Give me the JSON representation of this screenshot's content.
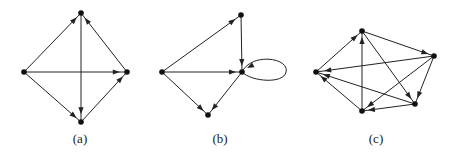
{
  "figure": {
    "edge_color": "#222222",
    "node_color": "#111111",
    "graphs": [
      {
        "label": "(a)",
        "label_x": 80,
        "nodes": {
          "top": [
            81,
            13
          ],
          "left": [
            24,
            72
          ],
          "right": [
            127,
            72
          ],
          "bottom": [
            81,
            122
          ]
        },
        "edges": [
          [
            "left",
            "top"
          ],
          [
            "right",
            "top"
          ],
          [
            "left",
            "right"
          ],
          [
            "top",
            "bottom"
          ],
          [
            "left",
            "bottom"
          ],
          [
            "bottom",
            "right"
          ]
        ],
        "loops": []
      },
      {
        "label": "(b)",
        "label_x": 220,
        "nodes": {
          "top": [
            241,
            15
          ],
          "left": [
            162,
            72
          ],
          "right": [
            242,
            72
          ],
          "bottom": [
            208,
            115
          ]
        },
        "edges": [
          [
            "left",
            "top"
          ],
          [
            "top",
            "right"
          ],
          [
            "left",
            "right"
          ],
          [
            "left",
            "bottom"
          ],
          [
            "right",
            "bottom"
          ]
        ],
        "loops": [
          "right"
        ]
      },
      {
        "label": "(c)",
        "label_x": 376,
        "nodes": {
          "top": [
            362,
            31
          ],
          "left": [
            316,
            72
          ],
          "right": [
            434,
            56
          ],
          "bottomright": [
            415,
            104
          ],
          "bottom": [
            362,
            111
          ]
        },
        "edges": [
          [
            "left",
            "top"
          ],
          [
            "bottom",
            "top"
          ],
          [
            "top",
            "right"
          ],
          [
            "top",
            "bottomright"
          ],
          [
            "right",
            "left"
          ],
          [
            "bottomright",
            "left"
          ],
          [
            "bottom",
            "left"
          ],
          [
            "right",
            "bottomright"
          ],
          [
            "right",
            "bottom"
          ],
          [
            "bottomright",
            "bottom"
          ]
        ],
        "loops": []
      }
    ]
  }
}
